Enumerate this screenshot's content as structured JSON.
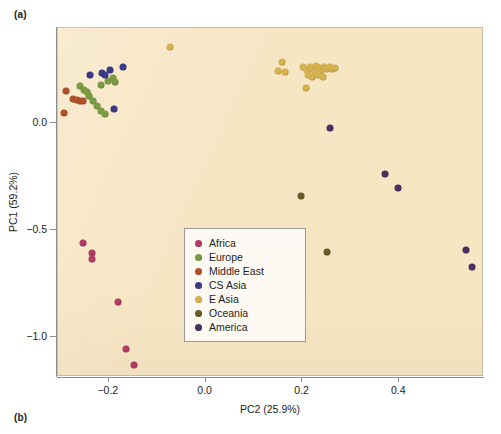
{
  "figure": {
    "panel_a_label": "(a)",
    "panel_b_label": "(b)"
  },
  "chart_data": {
    "type": "scatter",
    "title": "",
    "xlabel": "PC2 (25.9%)",
    "ylabel": "PC1 (59.2%)",
    "xlim": [
      -0.305,
      0.575
    ],
    "ylim": [
      -1.185,
      0.445
    ],
    "xticks": [
      -0.2,
      0.0,
      0.2,
      0.4
    ],
    "xticklabels": [
      "−0.2",
      "0.0",
      "0.2",
      "0.4"
    ],
    "yticks": [
      0.0,
      -0.5,
      -1.0
    ],
    "yticklabels": [
      "0.0",
      "−0.5",
      "−1.0"
    ],
    "grid": false,
    "background_color": "#f7e6c4",
    "legend_position": "center",
    "series": [
      {
        "name": "Africa",
        "color": "#b23a63",
        "points": [
          [
            -0.252,
            -0.565
          ],
          [
            -0.232,
            -0.611
          ],
          [
            -0.232,
            -0.637
          ],
          [
            -0.178,
            -0.84
          ],
          [
            -0.162,
            -1.06
          ],
          [
            -0.146,
            -1.134
          ]
        ]
      },
      {
        "name": "Europe",
        "color": "#7a9b42",
        "points": [
          [
            -0.258,
            0.17
          ],
          [
            -0.25,
            0.152
          ],
          [
            -0.244,
            0.14
          ],
          [
            -0.238,
            0.122
          ],
          [
            -0.23,
            0.1
          ],
          [
            -0.222,
            0.078
          ],
          [
            -0.214,
            0.055
          ],
          [
            -0.206,
            0.04
          ],
          [
            -0.214,
            0.172
          ],
          [
            -0.2,
            0.192
          ],
          [
            -0.19,
            0.205
          ],
          [
            -0.186,
            0.186
          ]
        ]
      },
      {
        "name": "Middle East",
        "color": "#b1522a",
        "points": [
          [
            -0.286,
            0.148
          ],
          [
            -0.272,
            0.108
          ],
          [
            -0.264,
            0.104
          ],
          [
            -0.258,
            0.1
          ],
          [
            -0.252,
            0.098
          ],
          [
            -0.29,
            0.042
          ]
        ]
      },
      {
        "name": "CS Asia",
        "color": "#3b3a87",
        "points": [
          [
            -0.236,
            0.22
          ],
          [
            -0.212,
            0.232
          ],
          [
            -0.206,
            0.222
          ],
          [
            -0.196,
            0.246
          ],
          [
            -0.168,
            0.26
          ],
          [
            -0.188,
            0.062
          ]
        ]
      },
      {
        "name": "E Asia",
        "color": "#d6b350",
        "points": [
          [
            -0.072,
            0.352
          ],
          [
            0.16,
            0.282
          ],
          [
            0.152,
            0.238
          ],
          [
            0.166,
            0.236
          ],
          [
            0.204,
            0.256
          ],
          [
            0.212,
            0.246
          ],
          [
            0.218,
            0.26
          ],
          [
            0.224,
            0.25
          ],
          [
            0.23,
            0.262
          ],
          [
            0.236,
            0.252
          ],
          [
            0.228,
            0.236
          ],
          [
            0.24,
            0.238
          ],
          [
            0.246,
            0.256
          ],
          [
            0.252,
            0.248
          ],
          [
            0.258,
            0.258
          ],
          [
            0.264,
            0.25
          ],
          [
            0.27,
            0.252
          ],
          [
            0.214,
            0.222
          ],
          [
            0.222,
            0.212
          ],
          [
            0.234,
            0.222
          ],
          [
            0.244,
            0.212
          ],
          [
            0.21,
            0.158
          ]
        ]
      },
      {
        "name": "Oceania",
        "color": "#6b5b24",
        "points": [
          [
            0.2,
            -0.345
          ],
          [
            0.252,
            -0.605
          ]
        ]
      },
      {
        "name": "America",
        "color": "#4a3060",
        "points": [
          [
            0.258,
            -0.028
          ],
          [
            0.372,
            -0.242
          ],
          [
            0.4,
            -0.305
          ],
          [
            0.54,
            -0.598
          ],
          [
            0.552,
            -0.675
          ]
        ]
      }
    ]
  }
}
